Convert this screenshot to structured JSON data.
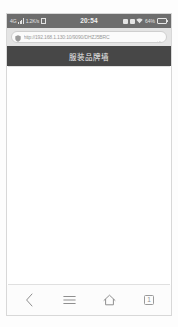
{
  "device": {
    "status_bar": {
      "carrier_signal_label": "4G",
      "signal_icon": "signal-bars-icon",
      "data_rate": "1.2K/s",
      "sim_icon": "sim-card-icon",
      "time": "20:54",
      "alarm_icon": "alarm-icon",
      "bluetooth_icon": "bluetooth-icon",
      "wifi_icon": "wifi-icon",
      "battery_percent": "64%",
      "battery_icon": "battery-icon",
      "battery_level": 82,
      "background_color": "#6d6d6d",
      "text_color": "#e9e9e9"
    }
  },
  "browser": {
    "omnibox": {
      "security_icon": "shield-icon",
      "url": "http://192.168.1.130:10/9090/DHZJ5BRC",
      "placeholder": "搜索或输入网址",
      "reload_icon": "reload-icon",
      "background_color": "#e4e4e4",
      "field_color": "#fbfbfb"
    },
    "page": {
      "title": "服装品牌墙",
      "title_bar_color": "#474747",
      "title_text_color": "#f0f0f0",
      "body_background": "#ffffff",
      "body_content": ""
    },
    "navbar": {
      "background_color": "#fcfcfc",
      "items": [
        {
          "name": "back-button",
          "icon": "chevron-left-icon",
          "label": ""
        },
        {
          "name": "menu-button",
          "icon": "hamburger-menu-icon",
          "label": ""
        },
        {
          "name": "home-button",
          "icon": "home-icon",
          "label": ""
        },
        {
          "name": "tabs-button",
          "icon": "tab-counter-icon",
          "label": "1"
        }
      ]
    }
  }
}
